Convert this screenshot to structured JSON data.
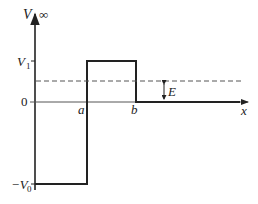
{
  "diagram": {
    "type": "potential-well",
    "labels": {
      "y_axis": "V",
      "infinity": "∞",
      "x_axis": "x",
      "v1": "V",
      "v1_sub": "1",
      "zero": "0",
      "neg_v0": "−V",
      "neg_v0_sub": "0",
      "a": "a",
      "b": "b",
      "energy": "E"
    },
    "colors": {
      "line": "#222222",
      "dashed": "#555555",
      "axis": "#333333"
    }
  }
}
